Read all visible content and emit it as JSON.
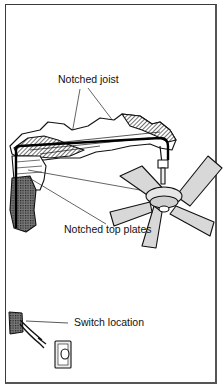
{
  "diagram": {
    "labels": {
      "notched_joist": "Notched joist",
      "notched_top_plates": "Notched top plates",
      "switch_location": "Switch location"
    },
    "components": [
      "ceiling joists",
      "cable run",
      "top plates",
      "wall cavity",
      "ceiling fan",
      "switch box",
      "wall switch"
    ],
    "colors": {
      "line": "#111111",
      "blade_fill": "#d8d8d8",
      "hatch": "#555555",
      "frame": "#3a3a3a",
      "background": "#ffffff"
    }
  }
}
